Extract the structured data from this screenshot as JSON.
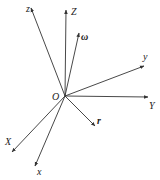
{
  "diagram": {
    "type": "coordinate-frames",
    "origin": {
      "label": "O",
      "x": 65,
      "y": 96
    },
    "line_color": "#333333",
    "vectors": [
      {
        "id": "z",
        "label": "z",
        "to": [
          31,
          8
        ],
        "label_pos": [
          26,
          12
        ],
        "bold": false
      },
      {
        "id": "Z",
        "label": "Z",
        "to": [
          66,
          10
        ],
        "label_pos": [
          71,
          15
        ],
        "bold": false
      },
      {
        "id": "omega",
        "label": "ω",
        "to": [
          79,
          33
        ],
        "label_pos": [
          81,
          40
        ],
        "bold": true
      },
      {
        "id": "y",
        "label": "y",
        "to": [
          144,
          66
        ],
        "label_pos": [
          143,
          60
        ],
        "bold": false
      },
      {
        "id": "Y",
        "label": "Y",
        "to": [
          148,
          97
        ],
        "label_pos": [
          149,
          109
        ],
        "bold": false
      },
      {
        "id": "r",
        "label": "r",
        "to": [
          95,
          126
        ],
        "label_pos": [
          97,
          124
        ],
        "bold": true
      },
      {
        "id": "X",
        "label": "X",
        "to": [
          12,
          152
        ],
        "label_pos": [
          5,
          145
        ],
        "bold": false
      },
      {
        "id": "x",
        "label": "x",
        "to": [
          35,
          166
        ],
        "label_pos": [
          37,
          175
        ],
        "bold": false
      }
    ]
  }
}
